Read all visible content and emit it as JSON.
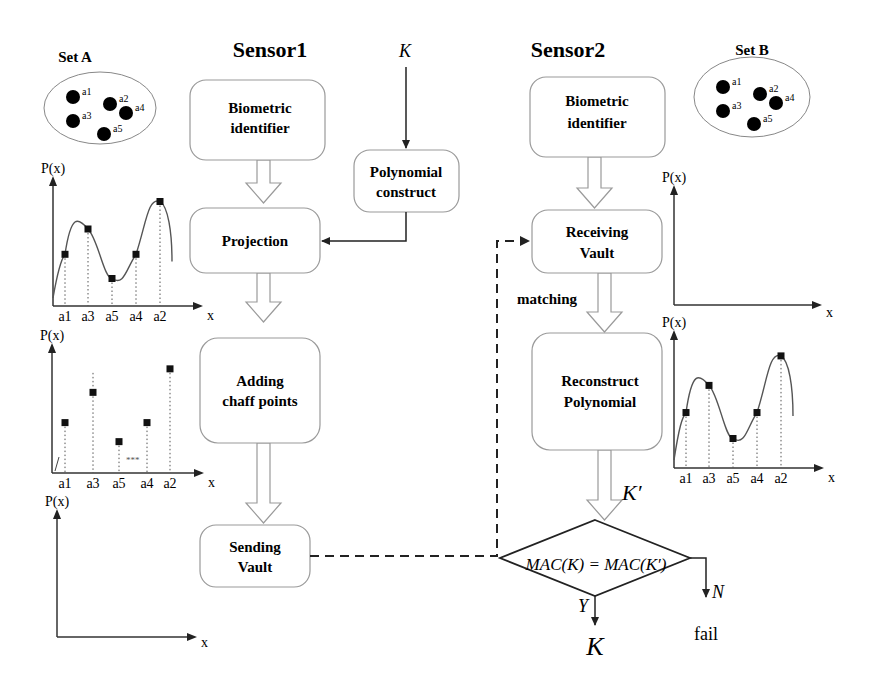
{
  "sensor1": {
    "title": "Sensor1",
    "boxes": [
      {
        "id": "biometric-identifier-1",
        "lines": [
          "Biometric",
          "identifier"
        ]
      },
      {
        "id": "projection",
        "lines": [
          "Projection"
        ]
      },
      {
        "id": "adding-chaff-points",
        "lines": [
          "Adding",
          "chaff points"
        ]
      },
      {
        "id": "sending-vault",
        "lines": [
          "Sending",
          "Vault"
        ]
      }
    ]
  },
  "key_input": {
    "label": "K"
  },
  "polynomial_construct": {
    "lines": [
      "Polynomial",
      "construct"
    ]
  },
  "sensor2": {
    "title": "Sensor2",
    "boxes": [
      {
        "id": "biometric-identifier-2",
        "lines": [
          "Biometric",
          "identifier"
        ]
      },
      {
        "id": "receiving-vault",
        "lines": [
          "Receiving",
          "Vault"
        ]
      },
      {
        "id": "reconstruct-polynomial",
        "lines": [
          "Reconstruct",
          "Polynomial"
        ]
      }
    ],
    "matching_label": "matching",
    "k_prime_label": "K′"
  },
  "decision": {
    "condition": "MAC(K) = MAC(K′)",
    "yes_label": "Y",
    "no_label": "N",
    "yes_output": "K",
    "no_output": "fail"
  },
  "set_a": {
    "title": "Set A",
    "elements": [
      "a1",
      "a2",
      "a3",
      "a4",
      "a5"
    ]
  },
  "set_b": {
    "title": "Set B",
    "elements": [
      "a1",
      "a2",
      "a3",
      "a4",
      "a5"
    ]
  },
  "plots": {
    "y_label": "P(x)",
    "x_label": "x",
    "x_ticks": [
      "a1",
      "a3",
      "a5",
      "a4",
      "a2"
    ],
    "polynomial_values": [
      0.47,
      0.7,
      0.25,
      0.47,
      0.95
    ],
    "vault_values": [
      0.45,
      0.72,
      0.28,
      0.45,
      0.93
    ],
    "chaff_marker": "***"
  }
}
